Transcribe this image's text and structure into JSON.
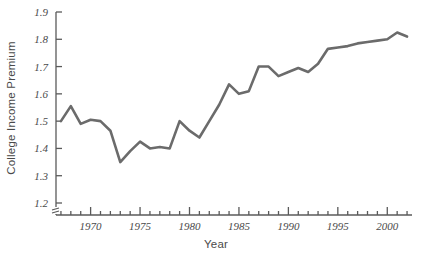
{
  "chart_data": {
    "type": "line",
    "title": "",
    "xlabel": "Year",
    "ylabel": "College Income Premium",
    "xlim": [
      1966.5,
      2002.5
    ],
    "ylim": [
      1.2,
      1.9
    ],
    "y_axis_break": true,
    "grid": false,
    "legend": null,
    "line_color": "#6b6b6b",
    "line_width": 2.6,
    "y_ticks": [
      1.2,
      1.3,
      1.4,
      1.5,
      1.6,
      1.7,
      1.8,
      1.9
    ],
    "y_tick_labels": [
      "1.2",
      "1.3",
      "1.4",
      "1.5",
      "1.6",
      "1.7",
      "1.8",
      "1.9"
    ],
    "x_ticks_major": [
      1970,
      1975,
      1980,
      1985,
      1990,
      1995,
      2000
    ],
    "x_tick_labels_major": [
      "1970",
      "1975",
      "1980",
      "1985",
      "1990",
      "1995",
      "2000"
    ],
    "x_ticks_minor_start": 1967,
    "x_ticks_minor_end": 2002,
    "x": [
      1967,
      1968,
      1969,
      1970,
      1971,
      1972,
      1973,
      1974,
      1975,
      1976,
      1977,
      1978,
      1979,
      1980,
      1981,
      1982,
      1983,
      1984,
      1985,
      1986,
      1987,
      1988,
      1989,
      1990,
      1991,
      1992,
      1993,
      1994,
      1995,
      1996,
      1997,
      1998,
      1999,
      2000,
      2001,
      2002
    ],
    "values": [
      1.5,
      1.555,
      1.49,
      1.505,
      1.5,
      1.465,
      1.35,
      1.39,
      1.425,
      1.4,
      1.405,
      1.4,
      1.5,
      1.465,
      1.44,
      1.5,
      1.56,
      1.635,
      1.6,
      1.61,
      1.7,
      1.7,
      1.665,
      1.68,
      1.695,
      1.68,
      1.71,
      1.765,
      1.77,
      1.775,
      1.785,
      1.79,
      1.795,
      1.8,
      1.825,
      1.81
    ],
    "series": [
      {
        "name": "College Income Premium",
        "values": [
          1.5,
          1.555,
          1.49,
          1.505,
          1.5,
          1.465,
          1.35,
          1.39,
          1.425,
          1.4,
          1.405,
          1.4,
          1.5,
          1.465,
          1.44,
          1.5,
          1.56,
          1.635,
          1.6,
          1.61,
          1.7,
          1.7,
          1.665,
          1.68,
          1.695,
          1.68,
          1.71,
          1.765,
          1.77,
          1.775,
          1.785,
          1.79,
          1.795,
          1.8,
          1.825,
          1.81
        ]
      }
    ]
  },
  "axes": {
    "y_title": "College Income Premium",
    "x_title": "Year"
  }
}
